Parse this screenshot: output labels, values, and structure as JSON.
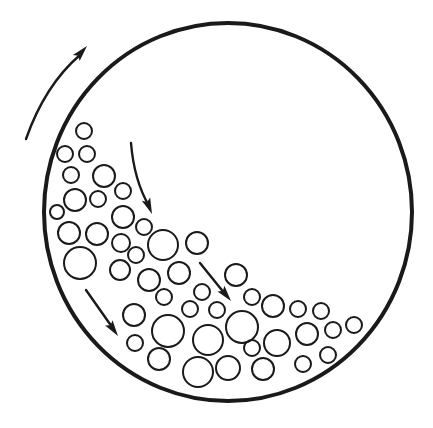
{
  "diagram": {
    "title": "",
    "colors": {
      "stroke": "#1a1a1a",
      "background": "#ffffff"
    },
    "drum": {
      "cx": 228,
      "cy": 212,
      "rx": 184,
      "ry": 189
    },
    "rotation_arrow": {
      "direction": "clockwise",
      "path": "M26,139 Q45,85 80,55",
      "tip": [
        87,
        46
      ],
      "angle": -48
    },
    "flow_arrows": [
      {
        "path": "M131,143 Q134,180 149,206",
        "tip": [
          152,
          214
        ],
        "angle": 68
      },
      {
        "path": "M200,263 L225,294",
        "tip": [
          231,
          301
        ],
        "angle": 51
      },
      {
        "path": "M86,290 L112,327",
        "tip": [
          118,
          336
        ],
        "angle": 55
      }
    ],
    "balls": [
      {
        "cx": 84,
        "cy": 131,
        "r": 8
      },
      {
        "cx": 65,
        "cy": 154,
        "r": 8
      },
      {
        "cx": 87,
        "cy": 154,
        "r": 8
      },
      {
        "cx": 71,
        "cy": 175,
        "r": 8
      },
      {
        "cx": 104,
        "cy": 176,
        "r": 11
      },
      {
        "cx": 123,
        "cy": 191,
        "r": 8
      },
      {
        "cx": 75,
        "cy": 200,
        "r": 11
      },
      {
        "cx": 98,
        "cy": 199,
        "r": 8
      },
      {
        "cx": 57,
        "cy": 212,
        "r": 7
      },
      {
        "cx": 123,
        "cy": 217,
        "r": 11
      },
      {
        "cx": 144,
        "cy": 227,
        "r": 8
      },
      {
        "cx": 69,
        "cy": 233,
        "r": 11
      },
      {
        "cx": 97,
        "cy": 234,
        "r": 11
      },
      {
        "cx": 121,
        "cy": 243,
        "r": 9
      },
      {
        "cx": 163,
        "cy": 245,
        "r": 15
      },
      {
        "cx": 197,
        "cy": 243,
        "r": 11
      },
      {
        "cx": 136,
        "cy": 255,
        "r": 8
      },
      {
        "cx": 80,
        "cy": 263,
        "r": 16
      },
      {
        "cx": 120,
        "cy": 270,
        "r": 10
      },
      {
        "cx": 149,
        "cy": 280,
        "r": 11
      },
      {
        "cx": 179,
        "cy": 273,
        "r": 11
      },
      {
        "cx": 236,
        "cy": 275,
        "r": 11
      },
      {
        "cx": 164,
        "cy": 297,
        "r": 8
      },
      {
        "cx": 202,
        "cy": 292,
        "r": 8
      },
      {
        "cx": 252,
        "cy": 297,
        "r": 8
      },
      {
        "cx": 190,
        "cy": 309,
        "r": 8
      },
      {
        "cx": 217,
        "cy": 310,
        "r": 8
      },
      {
        "cx": 273,
        "cy": 306,
        "r": 11
      },
      {
        "cx": 298,
        "cy": 309,
        "r": 8
      },
      {
        "cx": 321,
        "cy": 311,
        "r": 8
      },
      {
        "cx": 134,
        "cy": 315,
        "r": 11
      },
      {
        "cx": 168,
        "cy": 331,
        "r": 16
      },
      {
        "cx": 208,
        "cy": 340,
        "r": 15
      },
      {
        "cx": 242,
        "cy": 327,
        "r": 16
      },
      {
        "cx": 307,
        "cy": 334,
        "r": 11
      },
      {
        "cx": 333,
        "cy": 330,
        "r": 8
      },
      {
        "cx": 354,
        "cy": 325,
        "r": 8
      },
      {
        "cx": 135,
        "cy": 343,
        "r": 8
      },
      {
        "cx": 252,
        "cy": 348,
        "r": 8
      },
      {
        "cx": 277,
        "cy": 343,
        "r": 13
      },
      {
        "cx": 159,
        "cy": 359,
        "r": 11
      },
      {
        "cx": 198,
        "cy": 372,
        "r": 15
      },
      {
        "cx": 228,
        "cy": 368,
        "r": 12
      },
      {
        "cx": 263,
        "cy": 369,
        "r": 11
      },
      {
        "cx": 303,
        "cy": 364,
        "r": 8
      },
      {
        "cx": 328,
        "cy": 355,
        "r": 8
      }
    ]
  }
}
